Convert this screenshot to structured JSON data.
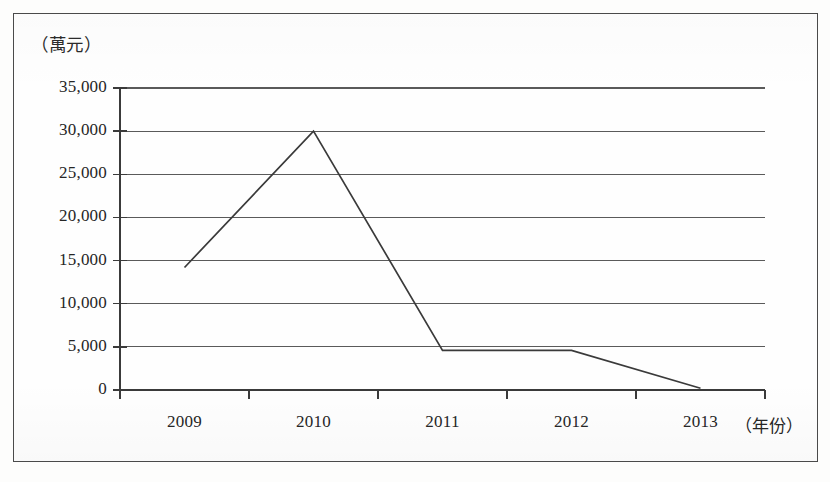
{
  "figure": {
    "frame_border_color": "#4a4a4a",
    "background_color": "#fefefe",
    "line_color": "#3a3a3a",
    "grid_color": "#5a5a5a",
    "axis_color": "#3a3a3a"
  },
  "chart_data": {
    "type": "line",
    "title": "",
    "subtitle": "",
    "xlabel": "（年份）",
    "ylabel": "（萬元）",
    "categories": [
      "2009",
      "2010",
      "2011",
      "2012",
      "2013"
    ],
    "series": [
      {
        "name": "",
        "values": [
          14200,
          30000,
          4600,
          4600,
          200
        ]
      }
    ],
    "ylim": [
      0,
      35000
    ],
    "yticks": [
      0,
      5000,
      10000,
      15000,
      20000,
      25000,
      30000,
      35000
    ],
    "ytick_labels": [
      "0",
      "5,000",
      "10,000",
      "15,000",
      "20,000",
      "25,000",
      "30,000",
      "35,000"
    ],
    "xtick_labels": [
      "2009",
      "2010",
      "2011",
      "2012",
      "2013"
    ],
    "grid": true,
    "grid_axis": "y",
    "legend": false,
    "legend_position": "none",
    "markers": false,
    "annotations": []
  },
  "axis_captions": {
    "y_unit": "（萬元）",
    "x_unit": "（年份）"
  }
}
